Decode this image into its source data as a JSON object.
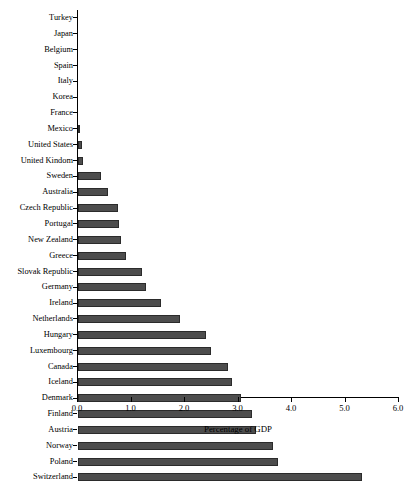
{
  "chart_data": {
    "type": "bar",
    "orientation": "horizontal",
    "title": "",
    "xlabel": "Percentage of GDP",
    "ylabel": "",
    "xlim": [
      0.0,
      6.0
    ],
    "xticks": [
      "0.0",
      "1.0",
      "2.0",
      "3.0",
      "4.0",
      "5.0",
      "6.0"
    ],
    "xtick_values": [
      0.0,
      1.0,
      2.0,
      3.0,
      4.0,
      5.0,
      6.0
    ],
    "grid": false,
    "legend": null,
    "bar_color": "#4d4d4d",
    "bar_edge_color": "#2b2b2b",
    "categories": [
      "Turkey",
      "Japan",
      "Belgium",
      "Spain",
      "Italy",
      "Korea",
      "France",
      "Mexico",
      "United States",
      "United Kindom",
      "Sweden",
      "Australia",
      "Czech Republic",
      "Portugal",
      "New Zealand",
      "Greece",
      "Slovak Republic",
      "Germany",
      "Ireland",
      "Netherlands",
      "Hungary",
      "Luxembourg",
      "Canada",
      "Iceland",
      "Denmark",
      "Finland",
      "Austria",
      "Norway",
      "Poland",
      "Switzerland"
    ],
    "values": [
      0.0,
      0.0,
      0.0,
      0.0,
      0.0,
      0.0,
      0.0,
      0.04,
      0.08,
      0.1,
      0.43,
      0.57,
      0.74,
      0.76,
      0.8,
      0.9,
      1.2,
      1.28,
      1.55,
      1.9,
      2.4,
      2.48,
      2.8,
      2.87,
      3.05,
      3.25,
      3.32,
      3.64,
      3.74,
      5.3
    ]
  }
}
